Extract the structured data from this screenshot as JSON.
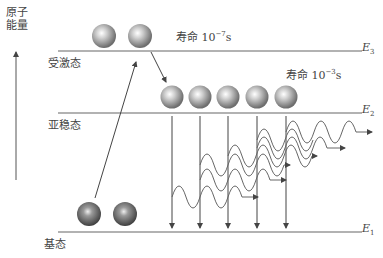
{
  "diagram": {
    "y_axis_label_line1": "原子",
    "y_axis_label_line2": "能量",
    "levels": {
      "E3": {
        "name": "受激态",
        "label": "E",
        "sub": "3",
        "lifetime_prefix": "寿命 10",
        "lifetime_exp": "−7",
        "lifetime_unit": "s"
      },
      "E2": {
        "name": "亚稳态",
        "label": "E",
        "sub": "2",
        "lifetime_prefix": "寿命 10",
        "lifetime_exp": "−3",
        "lifetime_unit": "s"
      },
      "E1": {
        "name": "基态",
        "label": "E",
        "sub": "1"
      }
    },
    "atoms": {
      "excited_count": 2,
      "metastable_count": 5,
      "ground_count": 2
    },
    "colors": {
      "line": "#555555",
      "atom_light": "#f2f2f2",
      "atom_dark": "#7a7a7a",
      "ground_atom_dark": "#5a5a5a"
    }
  }
}
